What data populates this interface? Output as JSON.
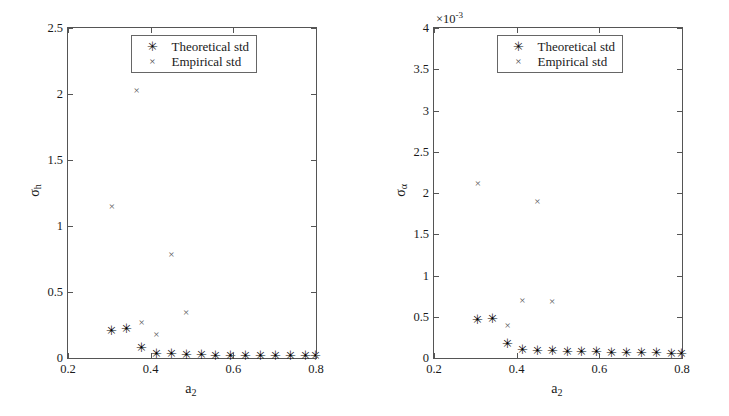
{
  "figure": {
    "panels": [
      {
        "id": "left",
        "y_axis_title": "σ",
        "y_axis_subscript": "h",
        "x_axis_title": "a",
        "x_axis_subscript": "2",
        "multiplier": "",
        "y_ticks": [
          "0",
          "0.5",
          "1",
          "1.5",
          "2",
          "2.5"
        ],
        "x_ticks": [
          "0.2",
          "0.4",
          "0.6",
          "0.8"
        ],
        "legend": [
          {
            "marker": "✳",
            "label": "Theoretical std"
          },
          {
            "marker": "×",
            "label": "Empirical std"
          }
        ]
      },
      {
        "id": "right",
        "y_axis_title": "σ",
        "y_axis_subscript": "α",
        "x_axis_title": "a",
        "x_axis_subscript": "2",
        "multiplier_base": "×10",
        "multiplier_exp": "-3",
        "y_ticks": [
          "0",
          "0.5",
          "1",
          "1.5",
          "2",
          "2.5",
          "3",
          "3.5",
          "4"
        ],
        "x_ticks": [
          "0.2",
          "0.4",
          "0.6",
          "0.8"
        ],
        "legend": [
          {
            "marker": "✳",
            "label": "Theoretical std"
          },
          {
            "marker": "×",
            "label": "Empirical std"
          }
        ]
      }
    ]
  },
  "chart_data": [
    {
      "type": "scatter",
      "title": "",
      "xlabel": "a_2",
      "ylabel": "sigma_h",
      "xlim": [
        0.2,
        0.8
      ],
      "ylim": [
        0,
        2.5
      ],
      "grid": false,
      "legend_position": "upper-center",
      "series": [
        {
          "name": "Theoretical std",
          "marker": "asterisk",
          "color": "#000000",
          "x": [
            0.306,
            0.342,
            0.378,
            0.414,
            0.45,
            0.486,
            0.522,
            0.558,
            0.594,
            0.63,
            0.666,
            0.702,
            0.738,
            0.774,
            0.798
          ],
          "y": [
            0.215,
            0.225,
            0.085,
            0.04,
            0.035,
            0.03,
            0.028,
            0.026,
            0.024,
            0.023,
            0.022,
            0.021,
            0.021,
            0.02,
            0.02
          ]
        },
        {
          "name": "Empirical std",
          "marker": "cross",
          "color": "#555555",
          "x": [
            0.306,
            0.378,
            0.414,
            0.45,
            0.366,
            0.486
          ],
          "y": [
            1.15,
            0.275,
            0.18,
            0.79,
            2.03,
            0.35
          ]
        }
      ]
    },
    {
      "type": "scatter",
      "title": "",
      "xlabel": "a_2",
      "ylabel": "sigma_alpha",
      "y_multiplier": 0.001,
      "xlim": [
        0.2,
        0.8
      ],
      "ylim": [
        0,
        4
      ],
      "grid": false,
      "legend_position": "upper-center",
      "series": [
        {
          "name": "Theoretical std",
          "marker": "asterisk",
          "color": "#000000",
          "x": [
            0.306,
            0.342,
            0.378,
            0.414,
            0.45,
            0.486,
            0.522,
            0.558,
            0.594,
            0.63,
            0.666,
            0.702,
            0.738,
            0.774,
            0.798
          ],
          "y": [
            0.475,
            0.49,
            0.18,
            0.115,
            0.1,
            0.095,
            0.09,
            0.085,
            0.08,
            0.075,
            0.072,
            0.07,
            0.068,
            0.066,
            0.065
          ]
        },
        {
          "name": "Empirical std",
          "marker": "cross",
          "color": "#555555",
          "x": [
            0.306,
            0.366,
            0.378,
            0.414,
            0.45,
            0.486
          ],
          "y": [
            2.12,
            3.57,
            0.4,
            0.7,
            1.9,
            0.69
          ]
        }
      ]
    }
  ]
}
